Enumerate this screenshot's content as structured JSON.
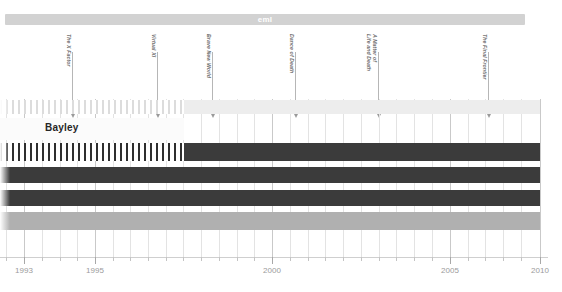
{
  "banner": {
    "label": "eml",
    "color": "#d2d2d2"
  },
  "callout": {
    "label": "Bayley"
  },
  "markers": [
    {
      "label": "The X Factor",
      "year": 1995.3,
      "x": 72
    },
    {
      "label": "Virtual XI",
      "year": 1998.0,
      "x": 157
    },
    {
      "label": "Brave New World",
      "year": 1999.5,
      "x": 212
    },
    {
      "label": "Dance of Death",
      "year": 2002.0,
      "x": 295
    },
    {
      "label": "A Matter of\nLife and Death",
      "year": 2004.5,
      "x": 378
    },
    {
      "label": "The Final Frontier",
      "year": 2007.5,
      "x": 488
    }
  ],
  "rows": [
    {
      "name": "row-1",
      "top": 1,
      "height": 14,
      "segments": [
        {
          "style": "striped-light",
          "x": 0,
          "width": 184
        },
        {
          "style": "solid-light",
          "x": 184,
          "width": 356
        }
      ]
    },
    {
      "name": "row-2",
      "top": 44,
      "height": 18,
      "segments": [
        {
          "style": "striped",
          "x": 0,
          "width": 184
        },
        {
          "style": "solid-dark",
          "x": 184,
          "width": 356
        }
      ]
    },
    {
      "name": "row-3",
      "top": 68,
      "height": 16,
      "segments": [
        {
          "style": "solid-dark",
          "x": 0,
          "width": 540
        }
      ]
    },
    {
      "name": "row-4",
      "top": 91,
      "height": 16,
      "segments": [
        {
          "style": "solid-dark",
          "x": 0,
          "width": 540
        }
      ]
    },
    {
      "name": "row-5",
      "top": 113,
      "height": 18,
      "segments": [
        {
          "style": "solid-mid",
          "x": 0,
          "width": 540
        }
      ]
    }
  ],
  "axis": {
    "labels": [
      "1993",
      "1995",
      "2000",
      "2005",
      "2010"
    ],
    "label_x": [
      24,
      95,
      272,
      450,
      540
    ],
    "minor_tick_x": [
      6,
      42,
      60,
      77,
      113,
      130,
      148,
      166,
      183,
      201,
      219,
      237,
      254,
      290,
      308,
      325,
      343,
      361,
      379,
      396,
      414,
      432,
      468,
      485,
      503,
      521
    ],
    "major_tick_x": [
      24,
      95,
      272,
      450,
      540
    ]
  },
  "gridlines": {
    "minor_x": [
      6,
      42,
      60,
      77,
      113,
      130,
      148,
      166,
      183,
      201,
      219,
      237,
      254,
      290,
      308,
      325,
      343,
      361,
      379,
      396,
      414,
      432,
      468,
      485,
      503,
      521
    ],
    "major_x": [
      24,
      95,
      272,
      450,
      540
    ]
  },
  "colors": {
    "bar_dark": "#3b3b3b",
    "bar_mid": "#b0b0b0",
    "bar_light": "#ededed",
    "grid": "#e3e3e3",
    "axis_text": "#9b9b9b"
  }
}
